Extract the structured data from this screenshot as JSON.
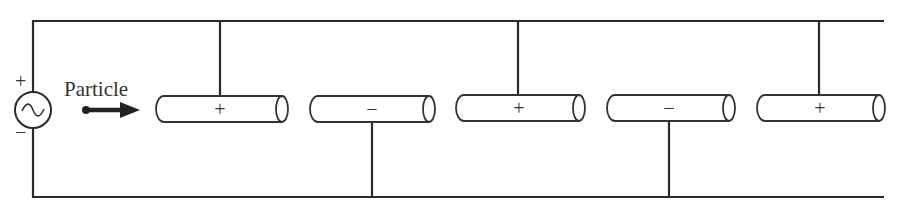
{
  "diagram": {
    "particle_label": "Particle",
    "source": {
      "type": "ac-source",
      "top_sign": "+",
      "bottom_sign": "−",
      "symbol": "~"
    },
    "tubes": [
      {
        "id": 1,
        "sign": "+",
        "connection": "top"
      },
      {
        "id": 2,
        "sign": "−",
        "connection": "bottom"
      },
      {
        "id": 3,
        "sign": "+",
        "connection": "top"
      },
      {
        "id": 4,
        "sign": "−",
        "connection": "bottom"
      },
      {
        "id": 5,
        "sign": "+",
        "connection": "top"
      }
    ],
    "colors": {
      "line": "#2a2a2a",
      "background": "#ffffff"
    }
  }
}
